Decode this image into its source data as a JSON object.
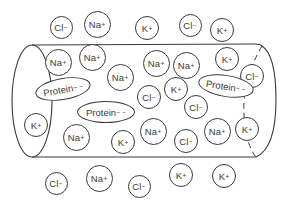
{
  "diagram": {
    "stroke_color": "#3a3a3a",
    "background_color": "#ffffff",
    "outside_top": [
      {
        "label": "Cl",
        "charge": "−",
        "x": 61,
        "y": 27,
        "d": 23
      },
      {
        "label": "Na",
        "charge": "+",
        "x": 97,
        "y": 24,
        "d": 27
      },
      {
        "label": "K",
        "charge": "+",
        "x": 147,
        "y": 28,
        "d": 24
      },
      {
        "label": "Cl",
        "charge": "−",
        "x": 190,
        "y": 25,
        "d": 23
      },
      {
        "label": "K",
        "charge": "+",
        "x": 222,
        "y": 30,
        "d": 24
      }
    ],
    "inside": [
      {
        "label": "Na",
        "charge": "+",
        "x": 58,
        "y": 62,
        "d": 27
      },
      {
        "label": "Na",
        "charge": "+",
        "x": 92,
        "y": 57,
        "d": 27
      },
      {
        "label": "Na",
        "charge": "+",
        "x": 120,
        "y": 77,
        "d": 27
      },
      {
        "label": "Na",
        "charge": "+",
        "x": 156,
        "y": 63,
        "d": 27
      },
      {
        "label": "Na",
        "charge": "+",
        "x": 186,
        "y": 65,
        "d": 27
      },
      {
        "label": "K",
        "charge": "+",
        "x": 227,
        "y": 59,
        "d": 24
      },
      {
        "label": "Cl",
        "charge": "−",
        "x": 252,
        "y": 76,
        "d": 24
      },
      {
        "label": "Cl",
        "charge": "−",
        "x": 149,
        "y": 97,
        "d": 24
      },
      {
        "label": "K",
        "charge": "+",
        "x": 176,
        "y": 89,
        "d": 24
      },
      {
        "label": "Cl",
        "charge": "−",
        "x": 196,
        "y": 107,
        "d": 24
      },
      {
        "label": "K",
        "charge": "+",
        "x": 36,
        "y": 125,
        "d": 24
      },
      {
        "label": "Na",
        "charge": "+",
        "x": 153,
        "y": 131,
        "d": 27
      },
      {
        "label": "Na",
        "charge": "+",
        "x": 217,
        "y": 131,
        "d": 27
      },
      {
        "label": "K",
        "charge": "+",
        "x": 247,
        "y": 129,
        "d": 24
      },
      {
        "label": "Na",
        "charge": "+",
        "x": 76,
        "y": 137,
        "d": 27
      },
      {
        "label": "K",
        "charge": "+",
        "x": 123,
        "y": 142,
        "d": 24
      },
      {
        "label": "Cl",
        "charge": "−",
        "x": 186,
        "y": 141,
        "d": 24
      }
    ],
    "proteins": [
      {
        "label": "Protein",
        "charge": "− −",
        "x": 63,
        "y": 89,
        "w": 56,
        "h": 22,
        "rotate": -10
      },
      {
        "label": "Protein",
        "charge": "− −",
        "x": 226,
        "y": 86,
        "w": 56,
        "h": 22,
        "rotate": 9
      },
      {
        "label": "Protein",
        "charge": "− −",
        "x": 106,
        "y": 112,
        "w": 58,
        "h": 22,
        "rotate": 0
      }
    ],
    "outside_bottom": [
      {
        "label": "Cl",
        "charge": "−",
        "x": 56,
        "y": 183,
        "d": 23
      },
      {
        "label": "Na",
        "charge": "+",
        "x": 99,
        "y": 178,
        "d": 27
      },
      {
        "label": "Cl",
        "charge": "−",
        "x": 139,
        "y": 186,
        "d": 23
      },
      {
        "label": "K",
        "charge": "+",
        "x": 181,
        "y": 175,
        "d": 24
      },
      {
        "label": "K",
        "charge": "+",
        "x": 224,
        "y": 176,
        "d": 24
      }
    ]
  }
}
